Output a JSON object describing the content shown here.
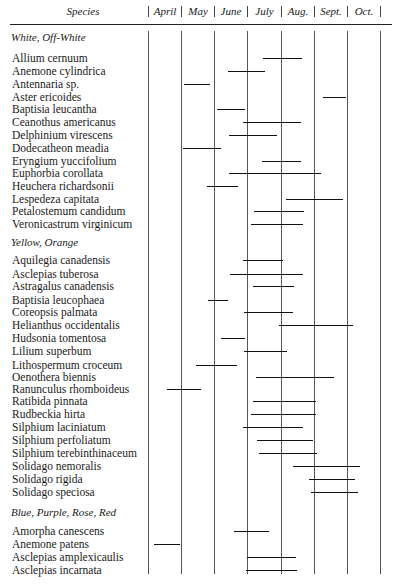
{
  "header": {
    "species_label": "Species",
    "months": [
      "April",
      "May",
      "June",
      "July",
      "Aug.",
      "Sept.",
      "Oct."
    ]
  },
  "chart_data": {
    "type": "table",
    "xlabel": "Month",
    "ylabel": "Species",
    "columns": [
      "April",
      "May",
      "June",
      "July",
      "Aug.",
      "Sept.",
      "Oct."
    ],
    "column_boundaries_px": [
      148,
      181,
      214,
      247,
      281,
      314,
      347,
      380
    ],
    "note": "Bars give flowering span; start/end expressed as fractional month index (0 = start of April, 7 = end of Oct.)",
    "groups": [
      {
        "name": "White, Off-White",
        "species": [
          {
            "name": "Allium cernuum",
            "start": 3.5,
            "end": 4.7
          },
          {
            "name": "Anemone cylindrica",
            "start": 2.4,
            "end": 3.5
          },
          {
            "name": "Antennaria sp.",
            "start": 1.1,
            "end": 1.9
          },
          {
            "name": "Aster ericoides",
            "start": 5.3,
            "end": 6.0
          },
          {
            "name": "Baptisia leucantha",
            "start": 2.1,
            "end": 2.9
          },
          {
            "name": "Ceanothus americanus",
            "start": 2.9,
            "end": 4.6
          },
          {
            "name": "Delphinium virescens",
            "start": 2.5,
            "end": 3.9
          },
          {
            "name": "Dodecatheon meadia",
            "start": 1.05,
            "end": 2.2
          },
          {
            "name": "Eryngium yuccifolium",
            "start": 3.5,
            "end": 4.6
          },
          {
            "name": "Euphorbia corollata",
            "start": 2.5,
            "end": 5.2
          },
          {
            "name": "Heuchera richardsonii",
            "start": 1.8,
            "end": 2.7
          },
          {
            "name": "Lespedeza capitata",
            "start": 4.2,
            "end": 5.9
          },
          {
            "name": "Petalostemum candidum",
            "start": 3.2,
            "end": 4.7
          },
          {
            "name": "Veronicastrum virginicum",
            "start": 3.1,
            "end": 4.7
          }
        ]
      },
      {
        "name": "Yellow, Orange",
        "species": [
          {
            "name": "Aquilegia canadensis",
            "start": 2.9,
            "end": 4.0
          },
          {
            "name": "Asclepias tuberosa",
            "start": 2.5,
            "end": 4.7
          },
          {
            "name": "Astragalus canadensis",
            "start": 3.2,
            "end": 4.4
          },
          {
            "name": "Baptisia leucophaea",
            "start": 1.8,
            "end": 2.4
          },
          {
            "name": "Coreopsis palmata",
            "start": 2.9,
            "end": 4.4
          },
          {
            "name": "Helianthus occidentalis",
            "start": 3.9,
            "end": 6.2
          },
          {
            "name": "Hudsonia tomentosa",
            "start": 2.2,
            "end": 2.9
          },
          {
            "name": "Lilium superbum",
            "start": 2.9,
            "end": 4.2
          },
          {
            "name": "Lithospermum croceum",
            "start": 1.5,
            "end": 2.7
          },
          {
            "name": "Oenothera biennis",
            "start": 3.3,
            "end": 5.6
          },
          {
            "name": "Ranunculus rhomboideus",
            "start": 0.6,
            "end": 1.6
          },
          {
            "name": "Ratibida pinnata",
            "start": 3.2,
            "end": 5.0
          },
          {
            "name": "Rudbeckia hirta",
            "start": 3.1,
            "end": 5.0
          },
          {
            "name": "Silphium laciniatum",
            "start": 2.9,
            "end": 4.7
          },
          {
            "name": "Silphium perfoliatum",
            "start": 3.3,
            "end": 5.0
          },
          {
            "name": "Silphium terebinthinaceum",
            "start": 3.4,
            "end": 5.1
          },
          {
            "name": "Solidago nemoralis",
            "start": 4.4,
            "end": 6.4
          },
          {
            "name": "Solidago rigida",
            "start": 4.9,
            "end": 6.3
          },
          {
            "name": "Solidago speciosa",
            "start": 4.9,
            "end": 6.3
          }
        ]
      },
      {
        "name": "Blue, Purple, Rose, Red",
        "species": [
          {
            "name": "Amorpha canescens",
            "start": 2.6,
            "end": 3.7
          },
          {
            "name": "Anemone patens",
            "start": 0.2,
            "end": 1.0
          },
          {
            "name": "Asclepias amplexicaulis",
            "start": 3.0,
            "end": 4.5
          },
          {
            "name": "Asclepias incarnata",
            "start": 3.0,
            "end": 4.5
          }
        ]
      }
    ]
  },
  "layout": {
    "rows": [
      {
        "type": "section",
        "label": "White, Off-White",
        "y": 31
      },
      {
        "type": "species",
        "label": "Allium cernuum",
        "y": 52,
        "x1": 263,
        "x2": 302
      },
      {
        "type": "species",
        "label": "Anemone cylindrica",
        "y": 65,
        "x1": 228,
        "x2": 265
      },
      {
        "type": "species",
        "label": "Antennaria sp.",
        "y": 78,
        "x1": 184,
        "x2": 210
      },
      {
        "type": "species",
        "label": "Aster ericoides",
        "y": 91,
        "x1": 323,
        "x2": 346
      },
      {
        "type": "species",
        "label": "Baptisia leucantha",
        "y": 103,
        "x1": 217,
        "x2": 245
      },
      {
        "type": "species",
        "label": "Ceanothus americanus",
        "y": 116,
        "x1": 243,
        "x2": 301
      },
      {
        "type": "species",
        "label": "Delphinium virescens",
        "y": 129,
        "x1": 229,
        "x2": 277
      },
      {
        "type": "species",
        "label": "Dodecatheon meadia",
        "y": 142,
        "x1": 183,
        "x2": 221
      },
      {
        "type": "species",
        "label": "Eryngium yuccifolium",
        "y": 155,
        "x1": 262,
        "x2": 301
      },
      {
        "type": "species",
        "label": "Euphorbia corollata",
        "y": 167,
        "x1": 229,
        "x2": 321
      },
      {
        "type": "species",
        "label": "Heuchera richardsonii",
        "y": 180,
        "x1": 207,
        "x2": 238
      },
      {
        "type": "species",
        "label": "Lespedeza capitata",
        "y": 193,
        "x1": 286,
        "x2": 343
      },
      {
        "type": "species",
        "label": "Petalostemum candidum",
        "y": 205,
        "x1": 254,
        "x2": 304
      },
      {
        "type": "species",
        "label": "Veronicastrum virginicum",
        "y": 218,
        "x1": 251,
        "x2": 303
      },
      {
        "type": "section",
        "label": "Yellow, Orange",
        "y": 236
      },
      {
        "type": "species",
        "label": "Aquilegia canadensis",
        "y": 254,
        "x1": 243,
        "x2": 283
      },
      {
        "type": "species",
        "label": "Asclepias tuberosa",
        "y": 268,
        "x1": 230,
        "x2": 303
      },
      {
        "type": "species",
        "label": "Astragalus canadensis",
        "y": 280,
        "x1": 253,
        "x2": 294
      },
      {
        "type": "species",
        "label": "Baptisia leucophaea",
        "y": 294,
        "x1": 208,
        "x2": 228
      },
      {
        "type": "species",
        "label": "Coreopsis palmata",
        "y": 306,
        "x1": 244,
        "x2": 293
      },
      {
        "type": "species",
        "label": "Helianthus occidentalis",
        "y": 319,
        "x1": 279,
        "x2": 353
      },
      {
        "type": "species",
        "label": "Hudsonia tomentosa",
        "y": 332,
        "x1": 221,
        "x2": 245
      },
      {
        "type": "species",
        "label": "Lilium superbum",
        "y": 345,
        "x1": 244,
        "x2": 287
      },
      {
        "type": "species",
        "label": "Lithospermum croceum",
        "y": 359,
        "x1": 196,
        "x2": 237
      },
      {
        "type": "species",
        "label": "Oenothera biennis",
        "y": 371,
        "x1": 256,
        "x2": 334
      },
      {
        "type": "species",
        "label": "Ranunculus rhomboideus",
        "y": 383,
        "x1": 167,
        "x2": 201
      },
      {
        "type": "species",
        "label": "Ratibida pinnata",
        "y": 395,
        "x1": 253,
        "x2": 316
      },
      {
        "type": "species",
        "label": "Rudbeckia hirta",
        "y": 408,
        "x1": 251,
        "x2": 316
      },
      {
        "type": "species",
        "label": "Silphium laciniatum",
        "y": 421,
        "x1": 243,
        "x2": 303
      },
      {
        "type": "species",
        "label": "Silphium perfoliatum",
        "y": 434,
        "x1": 257,
        "x2": 313
      },
      {
        "type": "species",
        "label": "Silphium terebinthinaceum",
        "y": 447,
        "x1": 259,
        "x2": 317
      },
      {
        "type": "species",
        "label": "Solidago nemoralis",
        "y": 460,
        "x1": 293,
        "x2": 360
      },
      {
        "type": "species",
        "label": "Solidago rigida",
        "y": 473,
        "x1": 309,
        "x2": 355
      },
      {
        "type": "species",
        "label": "Solidago speciosa",
        "y": 486,
        "x1": 311,
        "x2": 358
      },
      {
        "type": "section",
        "label": "Blue, Purple, Rose, Red",
        "y": 506
      },
      {
        "type": "species",
        "label": "Amorpha canescens",
        "y": 525,
        "x1": 234,
        "x2": 269
      },
      {
        "type": "species",
        "label": "Anemone patens",
        "y": 538,
        "x1": 154,
        "x2": 180
      },
      {
        "type": "species",
        "label": "Asclepias amplexicaulis",
        "y": 551,
        "x1": 247,
        "x2": 296
      },
      {
        "type": "species",
        "label": "Asclepias incarnata",
        "y": 564,
        "x1": 246,
        "x2": 297
      }
    ]
  }
}
